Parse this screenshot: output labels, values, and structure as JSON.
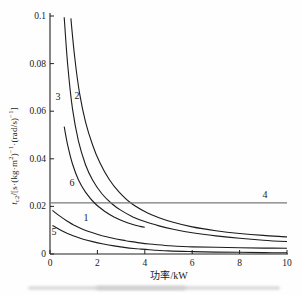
{
  "figure": {
    "xlabel": "功率/kW",
    "ylabel_plain": "tc2/[s·(kg·m2)-1·(rad/s)-1]",
    "ylabel_parts": [
      {
        "text": "t",
        "style": "it"
      },
      {
        "text": "c2",
        "style": "sub"
      },
      {
        "text": "/[s·(kg·m",
        "style": ""
      },
      {
        "text": "2",
        "style": "sup"
      },
      {
        "text": ")",
        "style": ""
      },
      {
        "text": "−1",
        "style": "sup"
      },
      {
        "text": "·(rad/s)",
        "style": ""
      },
      {
        "text": "−1",
        "style": "sup"
      },
      {
        "text": "]",
        "style": ""
      }
    ],
    "caption_smudge": true
  },
  "chart_data": {
    "type": "line",
    "title": "",
    "xlabel": "功率/kW",
    "ylabel": "t_c2/[s·(kg·m²)⁻¹·(rad/s)⁻¹]",
    "xlim": [
      0,
      10
    ],
    "ylim": [
      0,
      0.1
    ],
    "x_ticks": [
      0,
      2,
      4,
      6,
      8,
      10
    ],
    "x_tick_labels": [
      "0",
      "2",
      "4",
      "6",
      "8",
      "10"
    ],
    "y_ticks": [
      0,
      0.02,
      0.04,
      0.06,
      0.08,
      0.1
    ],
    "y_tick_labels": [
      "0",
      "0.02",
      "0.04",
      "0.06",
      "0.08",
      "0.1"
    ],
    "grid": false,
    "legend_position": "none (curves numbered inline)",
    "series": [
      {
        "name": "1",
        "label": "1",
        "label_pos": [
          1.52,
          0.0151
        ],
        "straight": false,
        "points": [
          [
            0.1,
            0.0183
          ],
          [
            0.4,
            0.016
          ],
          [
            0.7,
            0.014
          ],
          [
            1.0,
            0.0122
          ],
          [
            1.4,
            0.0103
          ],
          [
            1.8,
            0.0089
          ],
          [
            2.2,
            0.0077
          ],
          [
            2.7,
            0.0065
          ],
          [
            3.2,
            0.0056
          ],
          [
            3.7,
            0.0048
          ],
          [
            4.2,
            0.0042
          ],
          [
            5,
            0.0035
          ],
          [
            6,
            0.003
          ],
          [
            7,
            0.0028
          ],
          [
            8,
            0.0026
          ],
          [
            9,
            0.0025
          ],
          [
            10,
            0.0024
          ]
        ]
      },
      {
        "name": "2",
        "label": "2",
        "label_pos": [
          1.14,
          0.0664
        ],
        "straight": false,
        "points": [
          [
            0.88,
            0.099
          ],
          [
            1.05,
            0.082
          ],
          [
            1.25,
            0.0675
          ],
          [
            1.5,
            0.0555
          ],
          [
            1.8,
            0.0457
          ],
          [
            2.1,
            0.0385
          ],
          [
            2.5,
            0.0313
          ],
          [
            2.9,
            0.0262
          ],
          [
            3.4,
            0.0215
          ],
          [
            4.0,
            0.0178
          ],
          [
            4.6,
            0.0152
          ],
          [
            5.2,
            0.0133
          ],
          [
            6,
            0.0114
          ],
          [
            7,
            0.0098
          ],
          [
            8,
            0.0086
          ],
          [
            9,
            0.0078
          ],
          [
            10,
            0.0072
          ]
        ]
      },
      {
        "name": "3",
        "label": "3",
        "label_pos": [
          0.34,
          0.066
        ],
        "straight": false,
        "points": [
          [
            0.6,
            0.0995
          ],
          [
            0.75,
            0.079
          ],
          [
            0.95,
            0.061
          ],
          [
            1.2,
            0.0475
          ],
          [
            1.5,
            0.0375
          ],
          [
            1.8,
            0.031
          ],
          [
            2.2,
            0.0252
          ],
          [
            2.6,
            0.0212
          ],
          [
            3.0,
            0.0183
          ],
          [
            3.5,
            0.0156
          ],
          [
            4.0,
            0.0136
          ],
          [
            4.6,
            0.0118
          ],
          [
            5.2,
            0.0104
          ],
          [
            6,
            0.0089
          ],
          [
            7,
            0.0076
          ],
          [
            8,
            0.0066
          ],
          [
            9,
            0.0058
          ],
          [
            10,
            0.0052
          ]
        ]
      },
      {
        "name": "4",
        "label": "4",
        "label_pos": [
          9.07,
          0.0248
        ],
        "straight": true,
        "points": [
          [
            0,
            0.0215
          ],
          [
            10,
            0.0215
          ]
        ]
      },
      {
        "name": "5",
        "label": "5",
        "label_pos": [
          0.17,
          0.0092
        ],
        "straight": false,
        "points": [
          [
            0.1,
            0.012
          ],
          [
            0.4,
            0.0103
          ],
          [
            0.7,
            0.0088
          ],
          [
            1.0,
            0.0076
          ],
          [
            1.4,
            0.0062
          ],
          [
            1.8,
            0.0052
          ],
          [
            2.2,
            0.0043
          ],
          [
            2.7,
            0.0034
          ],
          [
            3.2,
            0.0027
          ],
          [
            3.7,
            0.0022
          ],
          [
            4.2,
            0.0018
          ],
          [
            5,
            0.0013
          ],
          [
            6,
            0.001
          ],
          [
            7,
            0.0008
          ],
          [
            8,
            0.0007
          ],
          [
            9,
            0.0006
          ],
          [
            10,
            0.0005
          ]
        ]
      },
      {
        "name": "6",
        "label": "6",
        "label_pos": [
          0.93,
          0.0298
        ],
        "straight": false,
        "points": [
          [
            0.6,
            0.0535
          ],
          [
            0.75,
            0.0455
          ],
          [
            0.95,
            0.0378
          ],
          [
            1.2,
            0.0312
          ],
          [
            1.5,
            0.026
          ],
          [
            1.9,
            0.0212
          ],
          [
            2.3,
            0.018
          ],
          [
            2.7,
            0.0156
          ],
          [
            3.1,
            0.0138
          ],
          [
            3.5,
            0.0124
          ],
          [
            3.8,
            0.0116
          ],
          [
            4.0,
            0.0112
          ]
        ]
      }
    ]
  },
  "colors": {
    "curve": "#1c1c1c",
    "line4": "#787878",
    "axis": "#222222",
    "text": "#1a1a1a",
    "smudge": "#dedede"
  }
}
